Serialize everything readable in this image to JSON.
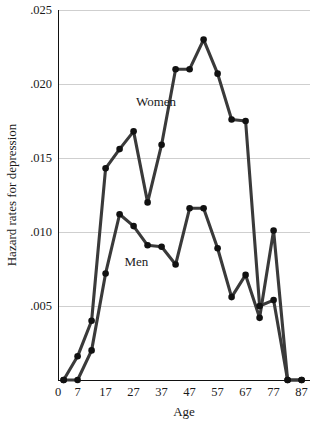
{
  "chart_data": {
    "type": "line",
    "title": "",
    "xlabel": "Age",
    "ylabel": "Hazard rates for depression",
    "xlim": [
      0,
      90
    ],
    "ylim": [
      0,
      0.025
    ],
    "grid": true,
    "legend_position": "inline-annotation",
    "x_ticks": [
      "0",
      "7",
      "17",
      "27",
      "37",
      "47",
      "57",
      "67",
      "77",
      "87"
    ],
    "x_tick_values": [
      0,
      7,
      17,
      27,
      37,
      47,
      57,
      67,
      77,
      87
    ],
    "y_ticks": [
      ".005",
      ".010",
      ".015",
      ".020",
      ".025"
    ],
    "y_tick_values": [
      0.005,
      0.01,
      0.015,
      0.02,
      0.025
    ],
    "x": [
      2,
      7,
      12,
      17,
      22,
      27,
      32,
      37,
      42,
      47,
      52,
      57,
      62,
      67,
      72,
      77,
      82,
      87
    ],
    "series": [
      {
        "name": "Women",
        "label": "Women",
        "color": "#3a3a3a",
        "label_x": 35,
        "label_y": 0.0185,
        "values": [
          0.0,
          0.0016,
          0.004,
          0.0143,
          0.0156,
          0.0168,
          0.012,
          0.0159,
          0.021,
          0.021,
          0.023,
          0.0207,
          0.0176,
          0.0175,
          0.005,
          0.0054,
          0.0,
          0.0
        ]
      },
      {
        "name": "Men",
        "label": "Men",
        "color": "#3a3a3a",
        "label_x": 28,
        "label_y": 0.0077,
        "values": [
          0.0,
          0.0,
          0.002,
          0.0072,
          0.0112,
          0.0104,
          0.0091,
          0.009,
          0.0078,
          0.0116,
          0.0116,
          0.0089,
          0.0056,
          0.0071,
          0.0042,
          0.0101,
          0.0,
          0.0
        ]
      }
    ]
  },
  "axis": {
    "x_title": "Age",
    "y_title": "Hazard rates for depression"
  },
  "colors": {
    "line": "#3a3a3a",
    "marker": "#111111",
    "grid": "#cfcfcf",
    "axis": "#111111",
    "background": "#ffffff",
    "text": "#1a1a1a"
  }
}
